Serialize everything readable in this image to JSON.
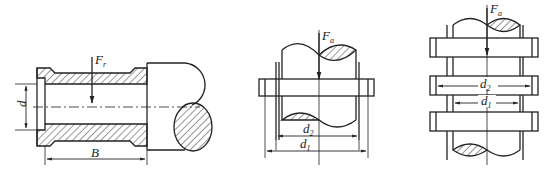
{
  "figure": {
    "colors": {
      "line": "#222222",
      "background": "#ffffff",
      "hatch": "#333333"
    },
    "panels": [
      {
        "id": "radial-bearing",
        "force_label": {
          "main": "F",
          "sub": "r"
        },
        "dim_labels": {
          "diameter": "d",
          "width": "B"
        }
      },
      {
        "id": "thrust-collar-single",
        "force_label": {
          "main": "F",
          "sub": "a"
        },
        "dim_labels": {
          "inner": {
            "main": "d",
            "sub": "2"
          },
          "outer": {
            "main": "d",
            "sub": "1"
          }
        }
      },
      {
        "id": "thrust-collar-multi",
        "force_label": {
          "main": "F",
          "sub": "a"
        },
        "dim_labels": {
          "outer": {
            "main": "d",
            "sub": "2"
          },
          "inner": {
            "main": "d",
            "sub": "1"
          }
        }
      }
    ]
  }
}
